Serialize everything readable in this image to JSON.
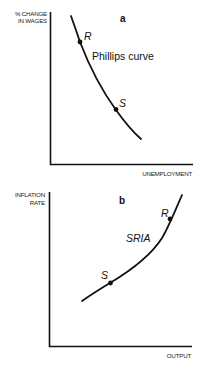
{
  "panel_a": {
    "letter": "a",
    "y_label_line1": "% CHANGE",
    "y_label_line2": "IN WAGES",
    "x_label": "UNEMPLOYMENT",
    "curve_label": "Phillips curve",
    "points": [
      {
        "label": "R"
      },
      {
        "label": "S"
      }
    ]
  },
  "panel_b": {
    "letter": "b",
    "y_label_line1": "INFLATION",
    "y_label_line2": "RATE",
    "x_label": "OUTPUT",
    "curve_label": "SRIA",
    "points": [
      {
        "label": "R"
      },
      {
        "label": "S"
      }
    ]
  },
  "colors": {
    "ink": "#111111",
    "background": "#ffffff"
  }
}
